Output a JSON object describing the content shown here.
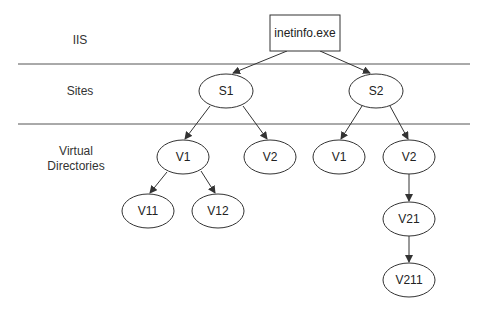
{
  "lanes": [
    {
      "label": "IIS"
    },
    {
      "label": "Sites"
    },
    {
      "label": "Virtual Directories"
    }
  ],
  "nodes": {
    "root": {
      "label": "inetinfo.exe",
      "shape": "rectangle"
    },
    "s1": {
      "label": "S1"
    },
    "s2": {
      "label": "S2"
    },
    "s1_v1": {
      "label": "V1"
    },
    "s1_v2": {
      "label": "V2"
    },
    "s2_v1": {
      "label": "V1"
    },
    "s2_v2": {
      "label": "V2"
    },
    "v11": {
      "label": "V11"
    },
    "v12": {
      "label": "V12"
    },
    "v21": {
      "label": "V21"
    },
    "v211": {
      "label": "V211"
    }
  },
  "edges": [
    [
      "root",
      "s1"
    ],
    [
      "root",
      "s2"
    ],
    [
      "s1",
      "s1_v1"
    ],
    [
      "s1",
      "s1_v2"
    ],
    [
      "s2",
      "s2_v1"
    ],
    [
      "s2",
      "s2_v2"
    ],
    [
      "s1_v1",
      "v11"
    ],
    [
      "s1_v1",
      "v12"
    ],
    [
      "s2_v2",
      "v21"
    ],
    [
      "v21",
      "v211"
    ]
  ],
  "colors": {
    "stroke": "#333333",
    "background": "#ffffff"
  }
}
